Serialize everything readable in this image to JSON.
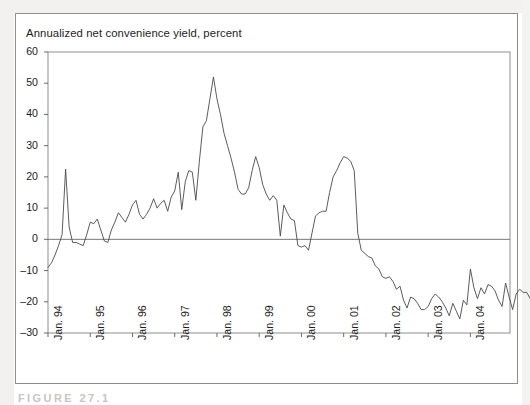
{
  "figure": {
    "axis_title": "Annualized net convenience yield, percent",
    "caption": "FIGURE 27.1"
  },
  "chart_data": {
    "type": "line",
    "title": "Annualized net convenience yield, percent",
    "xlabel": "",
    "ylabel": "Annualized net convenience yield, percent",
    "ylim": [
      -30,
      60
    ],
    "yticks": [
      -30,
      -20,
      -10,
      0,
      10,
      20,
      30,
      40,
      50,
      60
    ],
    "ytick_labels": [
      "–30",
      "–20",
      "–10",
      "0",
      "10",
      "20",
      "30",
      "40",
      "50",
      "60"
    ],
    "xticks": [
      "Jan. 94",
      "Jan. 95",
      "Jan. 96",
      "Jan. 97",
      "Jan. 98",
      "Jan. 99",
      "Jan. 00",
      "Jan. 01",
      "Jan. 02",
      "Jan. 03",
      "Jan. 04"
    ],
    "x_start": "Jan. 94",
    "x_end": "Dec. 04",
    "grid": false,
    "legend": null,
    "zero_line": true,
    "line_color": "#4a4a4a",
    "series": [
      {
        "name": "Annualized net convenience yield",
        "values": [
          -9.0,
          -7.5,
          -5.0,
          -2.0,
          1.5,
          22.5,
          4.0,
          -1.0,
          -1.0,
          -1.5,
          -2.0,
          1.5,
          5.5,
          5.0,
          6.5,
          3.0,
          -0.5,
          -1.0,
          3.0,
          5.5,
          8.5,
          7.0,
          5.5,
          8.0,
          11.0,
          12.5,
          8.0,
          6.5,
          8.0,
          10.0,
          13.0,
          10.0,
          11.5,
          12.5,
          9.0,
          13.5,
          15.5,
          21.5,
          9.5,
          18.5,
          22.0,
          21.5,
          12.5,
          25.0,
          36.0,
          38.0,
          45.0,
          52.0,
          45.0,
          40.0,
          34.0,
          30.0,
          26.0,
          21.5,
          16.0,
          14.5,
          14.5,
          16.5,
          22.0,
          26.5,
          23.0,
          17.5,
          14.5,
          12.5,
          14.0,
          12.5,
          1.0,
          11.0,
          8.5,
          6.5,
          6.0,
          -2.0,
          -2.5,
          -2.0,
          -3.5,
          2.0,
          7.5,
          8.5,
          9.0,
          9.0,
          15.0,
          20.0,
          22.0,
          24.5,
          26.5,
          26.0,
          25.0,
          22.0,
          2.0,
          -3.5,
          -4.5,
          -5.5,
          -6.0,
          -8.5,
          -9.5,
          -12.0,
          -12.5,
          -12.0,
          -13.5,
          -16.0,
          -15.0,
          -19.5,
          -22.0,
          -18.5,
          -19.0,
          -20.5,
          -22.5,
          -22.5,
          -21.5,
          -19.0,
          -17.5,
          -18.5,
          -20.0,
          -22.0,
          -24.5,
          -20.5,
          -23.0,
          -25.5,
          -19.5,
          -21.0,
          -9.5,
          -15.5,
          -19.0,
          -15.5,
          -17.5,
          -14.5,
          -15.0,
          -16.5,
          -19.5,
          -21.5,
          -14.0,
          -18.5,
          -22.5,
          -17.5,
          -16.0,
          -17.0,
          -17.0,
          -19.0,
          -21.0,
          -18.5,
          -16.0,
          -14.5,
          -17.5,
          -19.0,
          -16.0,
          -14.0,
          -13.0,
          -14.5,
          -17.5,
          -12.0
        ]
      }
    ]
  }
}
